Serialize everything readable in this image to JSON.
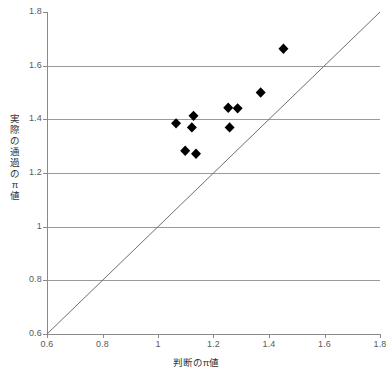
{
  "chart_data": {
    "type": "scatter",
    "title": "",
    "xlabel": "判断のπ値",
    "ylabel": "実際の通過のπ値",
    "xlim": [
      0.6,
      1.8
    ],
    "ylim": [
      0.6,
      1.8
    ],
    "xticks": [
      "0.6",
      "0.8",
      "1",
      "1.2",
      "1.4",
      "1.6",
      "1.8"
    ],
    "xtick_values": [
      0.6,
      0.8,
      1.0,
      1.2,
      1.4,
      1.6,
      1.8
    ],
    "yticks": [
      "0.6",
      "0.8",
      "1",
      "1.2",
      "1.4",
      "1.6",
      "1.8"
    ],
    "ytick_values": [
      0.6,
      0.8,
      1.0,
      1.2,
      1.4,
      1.6,
      1.8
    ],
    "grid": "horizontal",
    "gridlines_y": [
      0.8,
      1.0,
      1.2,
      1.4,
      1.6
    ],
    "legend": "none",
    "marker": "diamond",
    "marker_color": "#000000",
    "grid_color": "#9a9a9a",
    "axis_color": "#808080",
    "reference_line": {
      "name": "identity-line",
      "from": [
        0.6,
        0.6
      ],
      "to": [
        1.8,
        1.8
      ],
      "color": "#6f6f6f"
    },
    "points": [
      {
        "x": 1.065,
        "y": 1.385
      },
      {
        "x": 1.122,
        "y": 1.37
      },
      {
        "x": 1.128,
        "y": 1.413
      },
      {
        "x": 1.098,
        "y": 1.283
      },
      {
        "x": 1.137,
        "y": 1.272
      },
      {
        "x": 1.258,
        "y": 1.37
      },
      {
        "x": 1.253,
        "y": 1.443
      },
      {
        "x": 1.287,
        "y": 1.441
      },
      {
        "x": 1.37,
        "y": 1.5
      },
      {
        "x": 1.452,
        "y": 1.663
      }
    ]
  },
  "axis_titles": {
    "x": "判断のπ値",
    "y_chars": [
      "実",
      "際",
      "の",
      "通",
      "過",
      "の",
      "π",
      "値"
    ]
  }
}
